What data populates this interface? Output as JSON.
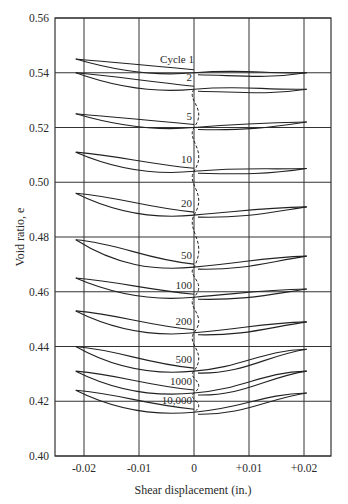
{
  "chart_data": {
    "type": "line",
    "title": "",
    "xlabel": "Shear displacement (in.)",
    "ylabel": "Void ratio, e",
    "xlim": [
      -0.025,
      0.025
    ],
    "ylim": [
      0.4,
      0.56
    ],
    "grid": true,
    "x_ticks": [
      -0.02,
      -0.01,
      0,
      0.01,
      0.02
    ],
    "x_tick_labels": [
      "-0.02",
      "-0.01",
      "0",
      "+0.01",
      "+0.02"
    ],
    "y_ticks": [
      0.4,
      0.42,
      0.44,
      0.46,
      0.48,
      0.5,
      0.52,
      0.54,
      0.56
    ],
    "y_tick_labels": [
      "0.40",
      "0.42",
      "0.44",
      "0.46",
      "0.48",
      "0.50",
      "0.52",
      "0.54",
      "0.56"
    ],
    "annotation": "Dashed line traces void ratio at zero displacement across cycles",
    "series": [
      {
        "name": "Cycle 1",
        "label": "Cycle 1",
        "left_tip": 0.545,
        "center": 0.54,
        "right_tip": 0.54
      },
      {
        "name": "Cycle 2",
        "label": "2",
        "left_tip": 0.54,
        "center": 0.534,
        "right_tip": 0.534
      },
      {
        "name": "Cycle 5",
        "label": "5",
        "left_tip": 0.525,
        "center": 0.52,
        "right_tip": 0.522
      },
      {
        "name": "Cycle 10",
        "label": "10",
        "left_tip": 0.511,
        "center": 0.504,
        "right_tip": 0.505
      },
      {
        "name": "Cycle 20",
        "label": "20",
        "left_tip": 0.496,
        "center": 0.488,
        "right_tip": 0.491
      },
      {
        "name": "Cycle 50",
        "label": "50",
        "left_tip": 0.479,
        "center": 0.469,
        "right_tip": 0.473
      },
      {
        "name": "Cycle 100",
        "label": "100",
        "left_tip": 0.465,
        "center": 0.458,
        "right_tip": 0.461
      },
      {
        "name": "Cycle 200",
        "label": "200",
        "left_tip": 0.453,
        "center": 0.445,
        "right_tip": 0.449
      },
      {
        "name": "Cycle 500",
        "label": "500",
        "left_tip": 0.44,
        "center": 0.431,
        "right_tip": 0.439
      },
      {
        "name": "Cycle 1000",
        "label": "1000",
        "left_tip": 0.431,
        "center": 0.423,
        "right_tip": 0.431
      },
      {
        "name": "Cycle 10,000",
        "label": "10,000",
        "left_tip": 0.424,
        "center": 0.416,
        "right_tip": 0.423
      }
    ]
  },
  "labels": {
    "xlabel": "Shear displacement (in.)",
    "ylabel": "Void ratio, e"
  }
}
